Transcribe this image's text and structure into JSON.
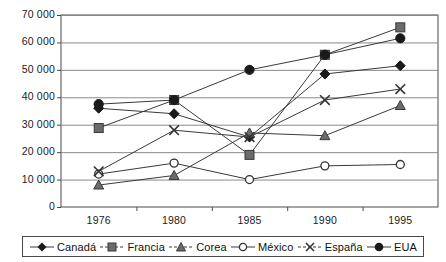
{
  "chart_data": {
    "type": "line",
    "title": "",
    "xlabel": "",
    "ylabel": "",
    "categories": [
      "1976",
      "1980",
      "1985",
      "1990",
      "1995"
    ],
    "ylim": [
      0,
      70000
    ],
    "yticks": [
      "0",
      "10 000",
      "20 000",
      "30 000",
      "40 000",
      "50 000",
      "60 000",
      "70 000"
    ],
    "ytick_values": [
      0,
      10000,
      20000,
      30000,
      40000,
      50000,
      60000,
      70000
    ],
    "grid": true,
    "legend_position": "bottom",
    "series": [
      {
        "name": "Canadá",
        "marker": "diamond",
        "color": "#1a1a1a",
        "values": [
          36000,
          34000,
          25500,
          48500,
          51500
        ]
      },
      {
        "name": "Francia",
        "marker": "square",
        "color": "#555555",
        "values": [
          28800,
          39000,
          19000,
          55500,
          65500
        ]
      },
      {
        "name": "Corea",
        "marker": "triangle",
        "color": "#555555",
        "values": [
          8000,
          11500,
          27000,
          26000,
          37000
        ]
      },
      {
        "name": "México",
        "marker": "open-circle",
        "color": "#333333",
        "values": [
          12000,
          16000,
          10000,
          15000,
          15500
        ]
      },
      {
        "name": "España",
        "marker": "cross",
        "color": "#333333",
        "values": [
          13000,
          28000,
          25500,
          39000,
          43000
        ]
      },
      {
        "name": "EUA",
        "marker": "filled-circle",
        "color": "#1a1a1a",
        "values": [
          37500,
          39000,
          50000,
          55500,
          61500
        ]
      }
    ]
  },
  "legend": {
    "items": [
      {
        "label": "Canadá",
        "marker": "diamond-marker-icon"
      },
      {
        "label": "Francia",
        "marker": "square-marker-icon"
      },
      {
        "label": "Corea",
        "marker": "triangle-marker-icon"
      },
      {
        "label": "México",
        "marker": "open-circle-marker-icon"
      },
      {
        "label": "España",
        "marker": "cross-marker-icon"
      },
      {
        "label": "EUA",
        "marker": "filled-circle-marker-icon"
      }
    ]
  }
}
